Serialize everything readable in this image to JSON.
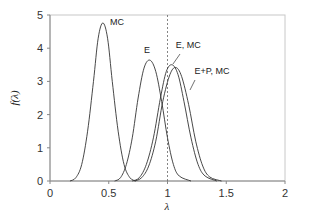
{
  "chart_data": {
    "type": "line",
    "title": "",
    "xlabel": "λ",
    "ylabel": "f(λ)",
    "xlim": [
      0,
      2
    ],
    "ylim": [
      0,
      5
    ],
    "xticks": [
      "0",
      "0.5",
      "1",
      "1.5",
      "2"
    ],
    "yticks": [
      "0",
      "1",
      "2",
      "3",
      "4",
      "5"
    ],
    "grid": false,
    "legend": "none (curves labeled by inline annotations)",
    "reference_line": {
      "x": 1.0,
      "style": "dashed vertical"
    },
    "series": [
      {
        "name": "MC",
        "peak_x": 0.45,
        "peak_y": 4.76,
        "support": [
          0.17,
          0.73
        ],
        "x": [
          0.17,
          0.22,
          0.27,
          0.32,
          0.37,
          0.41,
          0.45,
          0.49,
          0.53,
          0.58,
          0.63,
          0.68,
          0.73
        ],
        "y": [
          0.0,
          0.1,
          0.5,
          1.5,
          3.0,
          4.3,
          4.76,
          4.3,
          3.0,
          1.5,
          0.5,
          0.1,
          0.0
        ]
      },
      {
        "name": "E",
        "peak_x": 0.85,
        "peak_y": 3.64,
        "support": [
          0.55,
          1.2
        ],
        "x": [
          0.55,
          0.6,
          0.65,
          0.7,
          0.75,
          0.8,
          0.85,
          0.9,
          0.95,
          1.0,
          1.05,
          1.1,
          1.2
        ],
        "y": [
          0.0,
          0.1,
          0.5,
          1.3,
          2.5,
          3.4,
          3.64,
          3.3,
          2.4,
          1.3,
          0.5,
          0.15,
          0.0
        ]
      },
      {
        "name": "E, MC",
        "peak_x": 1.04,
        "peak_y": 3.5,
        "support": [
          0.7,
          1.42
        ],
        "x": [
          0.7,
          0.76,
          0.82,
          0.88,
          0.94,
          0.99,
          1.04,
          1.09,
          1.14,
          1.2,
          1.26,
          1.32,
          1.42
        ],
        "y": [
          0.0,
          0.1,
          0.5,
          1.3,
          2.5,
          3.3,
          3.5,
          3.2,
          2.4,
          1.3,
          0.5,
          0.15,
          0.0
        ]
      },
      {
        "name": "E+P, MC",
        "peak_x": 1.07,
        "peak_y": 3.42,
        "support": [
          0.72,
          1.46
        ],
        "x": [
          0.72,
          0.78,
          0.84,
          0.9,
          0.96,
          1.02,
          1.07,
          1.12,
          1.18,
          1.24,
          1.3,
          1.36,
          1.46
        ],
        "y": [
          0.0,
          0.1,
          0.45,
          1.2,
          2.4,
          3.2,
          3.42,
          3.15,
          2.3,
          1.2,
          0.45,
          0.12,
          0.0
        ]
      }
    ],
    "annotations": [
      {
        "text": "MC",
        "x": 0.51,
        "y": 4.7
      },
      {
        "text": "E",
        "x": 0.8,
        "y": 3.85
      },
      {
        "text": "E, MC",
        "x": 1.07,
        "y": 4.0
      },
      {
        "text": "E+P, MC",
        "x": 1.23,
        "y": 3.22
      }
    ]
  }
}
